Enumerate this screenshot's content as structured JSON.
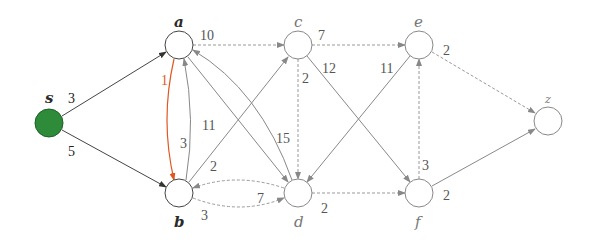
{
  "graph": {
    "type": "directed-weighted",
    "source_color": "#2e8b3a",
    "highlight_color": "#e0571f",
    "nodes": [
      {
        "id": "s",
        "label": "s",
        "x": 49,
        "y": 123,
        "filled": true
      },
      {
        "id": "a",
        "label": "a",
        "x": 179,
        "y": 45
      },
      {
        "id": "b",
        "label": "b",
        "x": 179,
        "y": 193
      },
      {
        "id": "c",
        "label": "c",
        "x": 298,
        "y": 45
      },
      {
        "id": "d",
        "label": "d",
        "x": 298,
        "y": 193
      },
      {
        "id": "e",
        "label": "e",
        "x": 419,
        "y": 45
      },
      {
        "id": "f",
        "label": "f",
        "x": 419,
        "y": 193
      },
      {
        "id": "z",
        "label": "z",
        "x": 548,
        "y": 121
      }
    ],
    "edges": [
      {
        "from": "s",
        "to": "a",
        "weight": "3",
        "style": "solid-dark"
      },
      {
        "from": "s",
        "to": "b",
        "weight": "5",
        "style": "solid-dark"
      },
      {
        "from": "a",
        "to": "b",
        "weight": "1",
        "style": "highlight"
      },
      {
        "from": "b",
        "to": "a",
        "weight": "3",
        "style": "solid"
      },
      {
        "from": "a",
        "to": "c",
        "weight": "10",
        "style": "dashed"
      },
      {
        "from": "a",
        "to": "d",
        "weight": "11",
        "style": "solid"
      },
      {
        "from": "d",
        "to": "a",
        "weight": "15",
        "style": "solid"
      },
      {
        "from": "b",
        "to": "c",
        "weight": "2",
        "style": "solid"
      },
      {
        "from": "b",
        "to": "d",
        "weight": "3",
        "style": "dashed"
      },
      {
        "from": "d",
        "to": "b",
        "weight": "7",
        "style": "dashed"
      },
      {
        "from": "c",
        "to": "d",
        "weight": "2",
        "style": "dashed"
      },
      {
        "from": "c",
        "to": "e",
        "weight": "7",
        "style": "dashed"
      },
      {
        "from": "c",
        "to": "f",
        "weight": "12",
        "style": "solid"
      },
      {
        "from": "e",
        "to": "d",
        "weight": "11",
        "style": "solid"
      },
      {
        "from": "e",
        "to": "z",
        "weight": "2",
        "style": "dashed"
      },
      {
        "from": "f",
        "to": "e",
        "weight": "3",
        "style": "dashed"
      },
      {
        "from": "d",
        "to": "f",
        "weight": "2",
        "style": "dashed"
      },
      {
        "from": "f",
        "to": "z",
        "weight": "2",
        "style": "solid"
      }
    ]
  }
}
